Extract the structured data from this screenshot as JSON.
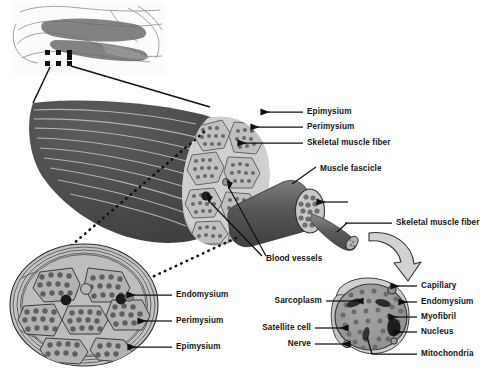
{
  "figure": {
    "background_color": "#ffffff",
    "ink_color": "#121212",
    "muscle_dark_gray": "#4a4a4a",
    "muscle_mid_gray": "#8d8d8d",
    "muscle_light_gray": "#b8b8b8",
    "fascicle_fill": "#c9c9c9",
    "connective_fill": "#d8d8d8"
  },
  "panels": {
    "arm_inset": {
      "name": "Arm with biceps brachii line drawing",
      "highlight_box": "dashed square callout"
    },
    "muscle_belly": {
      "name": "Whole skeletal muscle with cut cross-section"
    },
    "fascicle_magnifier": {
      "name": "Magnified fascicle cross-section circle"
    },
    "fiber_cell": {
      "name": "Single muscle fiber cross-section"
    }
  },
  "labels": {
    "muscle_callouts": [
      {
        "id": "epimysium",
        "text": "Epimysium",
        "x": 307,
        "y": 113
      },
      {
        "id": "perimysium",
        "text": "Perimysium",
        "x": 307,
        "y": 128
      },
      {
        "id": "skeletal-muscle-fiber",
        "text": "Skeletal muscle fiber",
        "x": 307,
        "y": 144
      },
      {
        "id": "muscle-fascicle",
        "text": "Muscle fascicle",
        "x": 320,
        "y": 170
      },
      {
        "id": "blood-vessels",
        "text": "Blood vessels",
        "x": 266,
        "y": 260
      },
      {
        "id": "skeletal-muscle-fiber-2",
        "text": "Skeletal muscle fiber",
        "x": 396,
        "y": 224
      }
    ],
    "magnifier_callouts": [
      {
        "id": "endomysium-mag",
        "text": "Endomysium",
        "x": 176,
        "y": 296
      },
      {
        "id": "perimysium-mag",
        "text": "Perimysium",
        "x": 176,
        "y": 322
      },
      {
        "id": "epimysium-mag",
        "text": "Epimysium",
        "x": 176,
        "y": 348
      }
    ],
    "fiber_cell_callouts_left": [
      {
        "id": "sarcoplasm",
        "text": "Sarcoplasm",
        "x": 322,
        "y": 302
      },
      {
        "id": "satellite-cell",
        "text": "Satellite cell",
        "x": 311,
        "y": 329
      },
      {
        "id": "nerve",
        "text": "Nerve",
        "x": 311,
        "y": 345
      }
    ],
    "fiber_cell_callouts_right": [
      {
        "id": "capillary",
        "text": "Capillary",
        "x": 421,
        "y": 287
      },
      {
        "id": "endomysium-fc",
        "text": "Endomysium",
        "x": 421,
        "y": 303
      },
      {
        "id": "myofibril",
        "text": "Myofibril",
        "x": 421,
        "y": 318
      },
      {
        "id": "nucleus",
        "text": "Nucleus",
        "x": 421,
        "y": 333
      },
      {
        "id": "mitochondria",
        "text": "Mitochondria",
        "x": 421,
        "y": 355
      }
    ]
  }
}
